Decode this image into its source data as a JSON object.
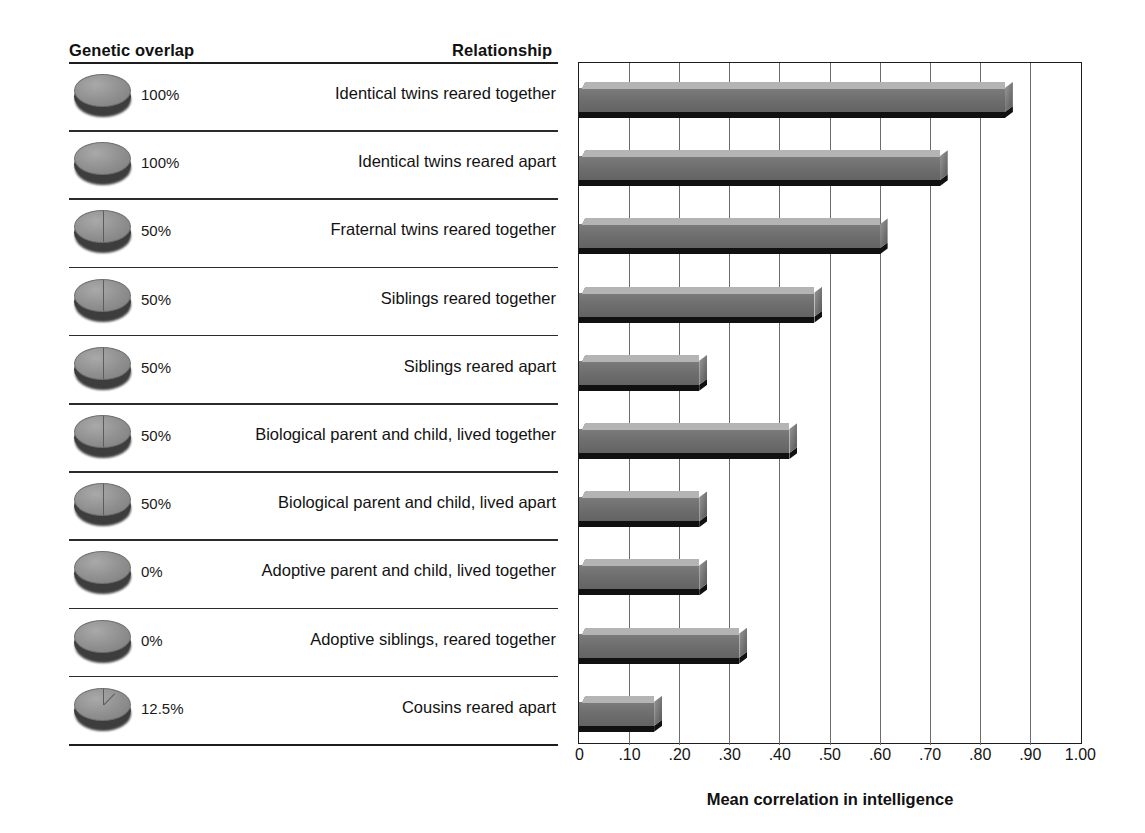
{
  "headers": {
    "genetic_overlap": "Genetic overlap",
    "relationship": "Relationship"
  },
  "axis": {
    "xlabel": "Mean correlation in intelligence",
    "ticks": [
      "0",
      ".10",
      ".20",
      ".30",
      ".40",
      ".50",
      ".60",
      ".70",
      ".80",
      ".90",
      "1.00"
    ],
    "tick_values": [
      0,
      0.1,
      0.2,
      0.3,
      0.4,
      0.5,
      0.6,
      0.7,
      0.8,
      0.9,
      1.0
    ]
  },
  "colors": {
    "bar_front": "#6f6f6f",
    "bar_top": "#b4b4b4",
    "bar_shadow": "#111111",
    "rule": "#2b2b2b",
    "gridline": "#6b6b6b",
    "coin_top": "#8f8f8f",
    "coin_side": "#3d3d3d"
  },
  "chart_data": {
    "type": "bar",
    "orientation": "horizontal",
    "title": "",
    "xlabel": "Mean correlation in intelligence",
    "ylabel": "Relationship",
    "xlim": [
      0,
      1.0
    ],
    "grid": true,
    "legend": "none",
    "categories": [
      "Identical twins reared together",
      "Identical twins reared apart",
      "Fraternal twins reared together",
      "Siblings reared together",
      "Siblings reared apart",
      "Biological parent and child, lived together",
      "Biological parent and child, lived apart",
      "Adoptive parent and child, lived together",
      "Adoptive siblings, reared together",
      "Cousins reared apart"
    ],
    "values": [
      0.85,
      0.72,
      0.6,
      0.47,
      0.24,
      0.42,
      0.24,
      0.24,
      0.32,
      0.15
    ],
    "genetic_overlap": [
      "100%",
      "100%",
      "50%",
      "50%",
      "50%",
      "50%",
      "50%",
      "0%",
      "0%",
      "12.5%"
    ],
    "genetic_overlap_fraction": [
      1.0,
      1.0,
      0.5,
      0.5,
      0.5,
      0.5,
      0.5,
      0.0,
      0.0,
      0.125
    ]
  },
  "rows": [
    {
      "overlap": "100%",
      "frac": 1.0,
      "relationship": "Identical twins reared together",
      "value": 0.85
    },
    {
      "overlap": "100%",
      "frac": 1.0,
      "relationship": "Identical twins reared apart",
      "value": 0.72
    },
    {
      "overlap": "50%",
      "frac": 0.5,
      "relationship": "Fraternal twins reared together",
      "value": 0.6
    },
    {
      "overlap": "50%",
      "frac": 0.5,
      "relationship": "Siblings reared together",
      "value": 0.47
    },
    {
      "overlap": "50%",
      "frac": 0.5,
      "relationship": "Siblings reared apart",
      "value": 0.24
    },
    {
      "overlap": "50%",
      "frac": 0.5,
      "relationship": "Biological parent and child, lived together",
      "value": 0.42
    },
    {
      "overlap": "50%",
      "frac": 0.5,
      "relationship": "Biological parent and child, lived apart",
      "value": 0.24
    },
    {
      "overlap": "0%",
      "frac": 0.0,
      "relationship": "Adoptive parent and child, lived together",
      "value": 0.24
    },
    {
      "overlap": "0%",
      "frac": 0.0,
      "relationship": "Adoptive siblings, reared together",
      "value": 0.32
    },
    {
      "overlap": "12.5%",
      "frac": 0.125,
      "relationship": "Cousins reared apart",
      "value": 0.15
    }
  ]
}
